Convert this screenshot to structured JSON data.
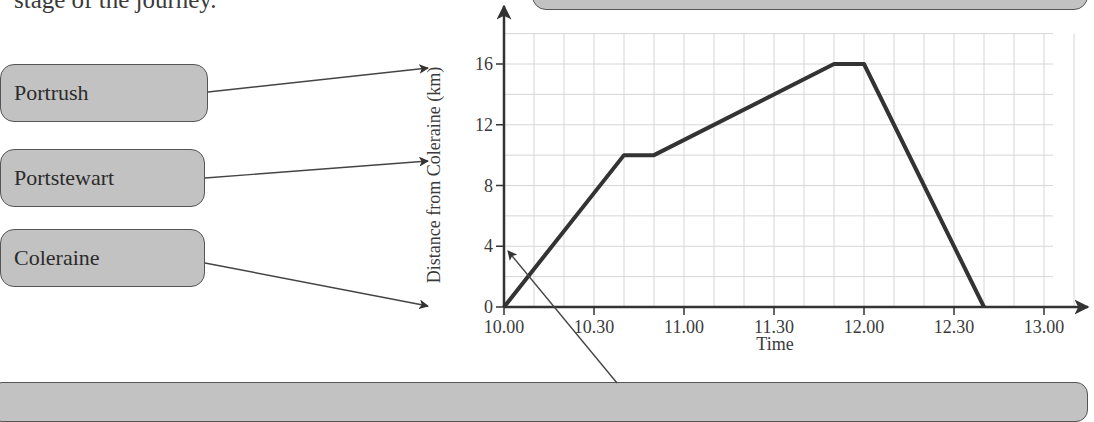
{
  "intro_text": "stage of the journey.",
  "labels": [
    {
      "text": "Portrush"
    },
    {
      "text": "Portstewart"
    },
    {
      "text": "Coleraine"
    }
  ],
  "colors": {
    "box_fill": "#c2c2c2",
    "box_border": "#555555",
    "line": "#333333",
    "grid": "#d6d6d6"
  },
  "chart_data": {
    "type": "line",
    "title": "",
    "xlabel": "Time",
    "ylabel": "Distance from Coleraine (km)",
    "x_ticks": [
      "10.00",
      "10.30",
      "11.00",
      "11.30",
      "12.00",
      "12.30",
      "13.00"
    ],
    "y_ticks": [
      "0",
      "4",
      "8",
      "12",
      "16"
    ],
    "xlim": [
      "10.00",
      "13.10"
    ],
    "ylim": [
      0,
      18
    ],
    "grid": true,
    "grid_x_step_minutes": 10,
    "grid_y_step_km": 2,
    "series": [
      {
        "name": "Journey",
        "x": [
          "10.00",
          "10.40",
          "10.50",
          "11.50",
          "12.00",
          "12.40"
        ],
        "y": [
          0,
          10,
          10,
          16,
          16,
          0
        ]
      }
    ]
  }
}
